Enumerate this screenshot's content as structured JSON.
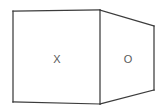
{
  "figure": {
    "name": "line-drawing-of-a-rectangular-box",
    "type": "2d-line-drawing",
    "background_color": "#ffffff",
    "stroke_color": "#3c3c3c",
    "label_color": "#5a5a5a",
    "stroke_width": 1.25,
    "canvas": {
      "width": 165,
      "height": 112
    },
    "faces": [
      {
        "id": "front-face",
        "label": "X",
        "shape": "rectangle",
        "label_position": {
          "x": 57,
          "y": 59
        },
        "corners": [
          {
            "x": 13,
            "y": 11
          },
          {
            "x": 100,
            "y": 10
          },
          {
            "x": 100,
            "y": 104
          },
          {
            "x": 13,
            "y": 102
          }
        ]
      },
      {
        "id": "side-face",
        "label": "O",
        "shape": "trapezoid",
        "label_position": {
          "x": 128,
          "y": 59
        },
        "corners": [
          {
            "x": 100,
            "y": 10
          },
          {
            "x": 154,
            "y": 26
          },
          {
            "x": 154,
            "y": 90
          },
          {
            "x": 100,
            "y": 104
          }
        ]
      }
    ],
    "edges": [
      {
        "id": "front-top-edge",
        "from": {
          "x": 13,
          "y": 11
        },
        "to": {
          "x": 100,
          "y": 10
        }
      },
      {
        "id": "front-right-edge",
        "from": {
          "x": 100,
          "y": 10
        },
        "to": {
          "x": 100,
          "y": 104
        }
      },
      {
        "id": "front-bottom-edge",
        "from": {
          "x": 100,
          "y": 104
        },
        "to": {
          "x": 13,
          "y": 102
        }
      },
      {
        "id": "front-left-edge",
        "from": {
          "x": 13,
          "y": 102
        },
        "to": {
          "x": 13,
          "y": 11
        }
      },
      {
        "id": "top-receding-edge",
        "from": {
          "x": 100,
          "y": 10
        },
        "to": {
          "x": 154,
          "y": 26
        }
      },
      {
        "id": "back-right-edge",
        "from": {
          "x": 154,
          "y": 26
        },
        "to": {
          "x": 154,
          "y": 90
        }
      },
      {
        "id": "bottom-receding-edge",
        "from": {
          "x": 154,
          "y": 90
        },
        "to": {
          "x": 100,
          "y": 104
        }
      }
    ],
    "labels": {
      "front": "X",
      "side": "O"
    }
  }
}
